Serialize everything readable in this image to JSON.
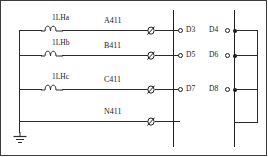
{
  "diagram": {
    "stroke_color": "#2b2b2b",
    "border_color": "#3c3c3c",
    "background": "#ffffff"
  },
  "coils": [
    {
      "id": "coil-a",
      "label": "1LHa"
    },
    {
      "id": "coil-b",
      "label": "1LHb"
    },
    {
      "id": "coil-c",
      "label": "1LHc"
    }
  ],
  "conductors": [
    {
      "id": "conductor-a",
      "label": "A411"
    },
    {
      "id": "conductor-b",
      "label": "B411"
    },
    {
      "id": "conductor-c",
      "label": "C411"
    },
    {
      "id": "conductor-n",
      "label": "N411"
    }
  ],
  "terminals_left": [
    {
      "id": "terminal-d3",
      "label": "D3"
    },
    {
      "id": "terminal-d5",
      "label": "D5"
    },
    {
      "id": "terminal-d7",
      "label": "D7"
    }
  ],
  "terminals_right": [
    {
      "id": "terminal-d4",
      "label": "D4"
    },
    {
      "id": "terminal-d6",
      "label": "D6"
    },
    {
      "id": "terminal-d8",
      "label": "D8"
    }
  ],
  "symbols": {
    "phi_terminal": "slashed-circle-terminal",
    "ground": "earth-ground",
    "coil": "inductor-coil",
    "junction": "junction-dot"
  }
}
